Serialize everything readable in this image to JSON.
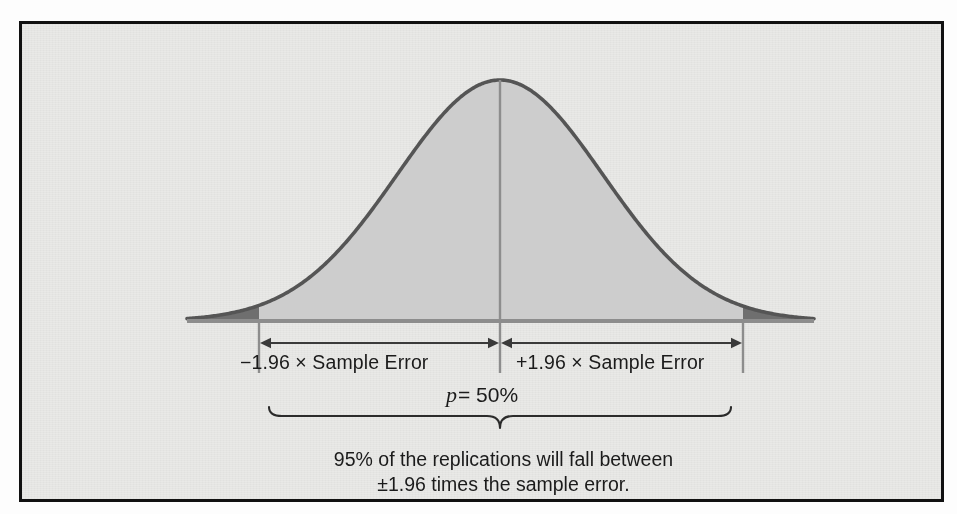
{
  "figure": {
    "title_visible": false,
    "frame_color": "#111111",
    "panel_background": "#e9e9e7"
  },
  "labels": {
    "left_interval": "−1.96 × Sample Error",
    "right_interval": "+1.96 × Sample Error",
    "p_symbol": "p",
    "p_equals_value": "= 50%",
    "caption_line1": "95% of the replications will fall between",
    "caption_line2": "±1.96 times the sample error."
  },
  "chart_data": {
    "type": "area",
    "title": "",
    "subtitle": "",
    "xlabel": "",
    "ylabel": "",
    "distribution": "normal",
    "mean_label": "p = 50%",
    "mean_value": 50,
    "mean_units": "%",
    "confidence_level": "95%",
    "z_multiplier": 1.96,
    "grid": false,
    "legend": null,
    "axis_baseline_y_px": 300,
    "curve_peak_y_px": 59,
    "x_px_range": [
      168,
      795
    ],
    "center_x_px": 481,
    "ci_lower_x_px": 240,
    "ci_upper_x_px": 724,
    "sigma_px": 103,
    "colors": {
      "curve_stroke": "#555555",
      "central_fill": "#cdcdcd",
      "tail_fill": "#6f6f6f",
      "baseline": "#8d8d8d",
      "annotation": "#3a3a3a"
    },
    "regions": [
      {
        "name": "left-tail",
        "from_z": -4.0,
        "to_z": -1.96,
        "fill": "#6f6f6f",
        "area_fraction": 0.025
      },
      {
        "name": "central-95",
        "from_z": -1.96,
        "to_z": 1.96,
        "fill": "#cdcdcd",
        "area_fraction": 0.95
      },
      {
        "name": "right-tail",
        "from_z": 1.96,
        "to_z": 4.0,
        "fill": "#6f6f6f",
        "area_fraction": 0.025
      }
    ],
    "annotations": [
      {
        "name": "left-arrow",
        "text": "−1.96 × Sample Error",
        "from_z": -1.96,
        "to_z": 0
      },
      {
        "name": "right-arrow",
        "text": "+1.96 × Sample Error",
        "from_z": 0,
        "to_z": 1.96
      },
      {
        "name": "center-line",
        "text": "p = 50%",
        "at_z": 0
      },
      {
        "name": "brace",
        "text": "95% of the replications will fall between ±1.96 times the sample error.",
        "from_z": -1.96,
        "to_z": 1.96
      }
    ],
    "x": [
      -4.0,
      -3.5,
      -3.0,
      -2.5,
      -1.96,
      -1.5,
      -1.0,
      -0.5,
      0.0,
      0.5,
      1.0,
      1.5,
      1.96,
      2.5,
      3.0,
      3.5,
      4.0
    ],
    "y": [
      0.0001,
      0.0009,
      0.0044,
      0.0175,
      0.0584,
      0.1295,
      0.242,
      0.3521,
      0.3989,
      0.3521,
      0.242,
      0.1295,
      0.0584,
      0.0175,
      0.0044,
      0.0009,
      0.0001
    ],
    "ylim": [
      0,
      0.4
    ],
    "xlim": [
      -4.0,
      4.0
    ]
  }
}
